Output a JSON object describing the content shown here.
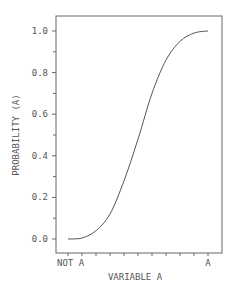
{
  "chart_data": {
    "type": "line",
    "title": "",
    "xlabel": "VARIABLE A",
    "ylabel": "PROBABILITY (A)",
    "x_tick_labels": [
      "NOT A",
      "A"
    ],
    "x_tick_count": 11,
    "y_tick_labels": [
      "0.0",
      "0.2",
      "0.4",
      "0.6",
      "0.8",
      "1.0"
    ],
    "ylim": [
      0.0,
      1.0
    ],
    "xlim": [
      0.0,
      1.0
    ],
    "grid": false,
    "legend": null,
    "x": [
      0.0,
      0.1,
      0.2,
      0.3,
      0.4,
      0.5,
      0.6,
      0.7,
      0.8,
      0.9,
      1.0
    ],
    "series": [
      {
        "name": "PROBABILITY (A)",
        "values": [
          0.0,
          0.005,
          0.04,
          0.12,
          0.28,
          0.48,
          0.7,
          0.86,
          0.95,
          0.99,
          1.0
        ]
      }
    ]
  },
  "colors": {
    "line": "#555555",
    "frame": "#666666",
    "background": "#ffffff"
  }
}
